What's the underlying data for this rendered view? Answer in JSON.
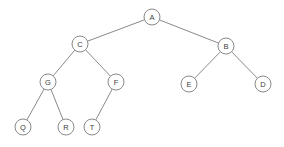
{
  "figure": {
    "width": 284,
    "height": 147,
    "background_color": "#ffffff",
    "node_stroke_color": "#8a8a8a",
    "node_fill_color": "#ffffff",
    "edge_color": "#8a8a8a",
    "label_color": "#3d3d3d",
    "node_radius": 8
  },
  "chart_data": {
    "type": "diagram",
    "diagram_kind": "binary-tree",
    "title": "",
    "nodes": [
      {
        "id": "A",
        "label": "A",
        "x": 152,
        "y": 17,
        "depth": 0,
        "parent": null
      },
      {
        "id": "C",
        "label": "C",
        "x": 80,
        "y": 44,
        "depth": 1,
        "parent": "A",
        "side": "left"
      },
      {
        "id": "B",
        "label": "B",
        "x": 226,
        "y": 46,
        "depth": 1,
        "parent": "A",
        "side": "right"
      },
      {
        "id": "G",
        "label": "G",
        "x": 48,
        "y": 82,
        "depth": 2,
        "parent": "C",
        "side": "left"
      },
      {
        "id": "F",
        "label": "F",
        "x": 116,
        "y": 82,
        "depth": 2,
        "parent": "C",
        "side": "right"
      },
      {
        "id": "E",
        "label": "E",
        "x": 189,
        "y": 84,
        "depth": 2,
        "parent": "B",
        "side": "left"
      },
      {
        "id": "D",
        "label": "D",
        "x": 263,
        "y": 84,
        "depth": 2,
        "parent": "B",
        "side": "right"
      },
      {
        "id": "Q",
        "label": "Q",
        "x": 23,
        "y": 127,
        "depth": 3,
        "parent": "G",
        "side": "left"
      },
      {
        "id": "R",
        "label": "R",
        "x": 66,
        "y": 127,
        "depth": 3,
        "parent": "G",
        "side": "right"
      },
      {
        "id": "T",
        "label": "T",
        "x": 92,
        "y": 127,
        "depth": 3,
        "parent": "F",
        "side": "left"
      }
    ],
    "edges": [
      {
        "from": "A",
        "to": "C"
      },
      {
        "from": "A",
        "to": "B"
      },
      {
        "from": "C",
        "to": "G"
      },
      {
        "from": "C",
        "to": "F"
      },
      {
        "from": "B",
        "to": "E"
      },
      {
        "from": "B",
        "to": "D"
      },
      {
        "from": "G",
        "to": "Q"
      },
      {
        "from": "G",
        "to": "R"
      },
      {
        "from": "F",
        "to": "T"
      }
    ],
    "root": "A",
    "node_count": 10,
    "edge_count": 9,
    "depth": 3
  }
}
